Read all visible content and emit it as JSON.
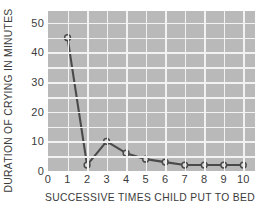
{
  "chart_data": {
    "type": "line",
    "title": "",
    "subtitle": "",
    "xlabel": "SUCCESSIVE TIMES CHILD PUT TO BED",
    "ylabel": "DURATION OF CRYING IN MINUTES",
    "x": [
      1,
      2,
      3,
      4,
      5,
      6,
      7,
      8,
      9,
      10
    ],
    "values": [
      45,
      2,
      10,
      6,
      4,
      3,
      2,
      2,
      2,
      2
    ],
    "series": [
      {
        "name": "Duration of crying",
        "values": [
          45,
          2,
          10,
          6,
          4,
          3,
          2,
          2,
          2,
          2
        ]
      }
    ],
    "xlim": [
      0,
      10.6
    ],
    "ylim": [
      0,
      54
    ],
    "xticks": [
      "0",
      "1",
      "2",
      "3",
      "4",
      "5",
      "6",
      "7",
      "8",
      "9",
      "10"
    ],
    "xtick_values": [
      0,
      1,
      2,
      3,
      4,
      5,
      6,
      7,
      8,
      9,
      10
    ],
    "yticks": [
      "0",
      "10",
      "20",
      "30",
      "40",
      "50"
    ],
    "ytick_values": [
      0,
      10,
      20,
      30,
      40,
      50
    ],
    "grid": true,
    "grid_minor_y_step": 5,
    "grid_minor_x_step": 1,
    "legend": "none",
    "marker": "open-circle",
    "colors": {
      "plot_background": "#b9b9b9",
      "gridline": "#f2f2f2",
      "line": "#4a4a4a",
      "marker_fill": "#d8d8d8",
      "marker_edge": "#4a4a4a",
      "text": "#3c3c3c",
      "figure_background": "#ffffff"
    }
  }
}
